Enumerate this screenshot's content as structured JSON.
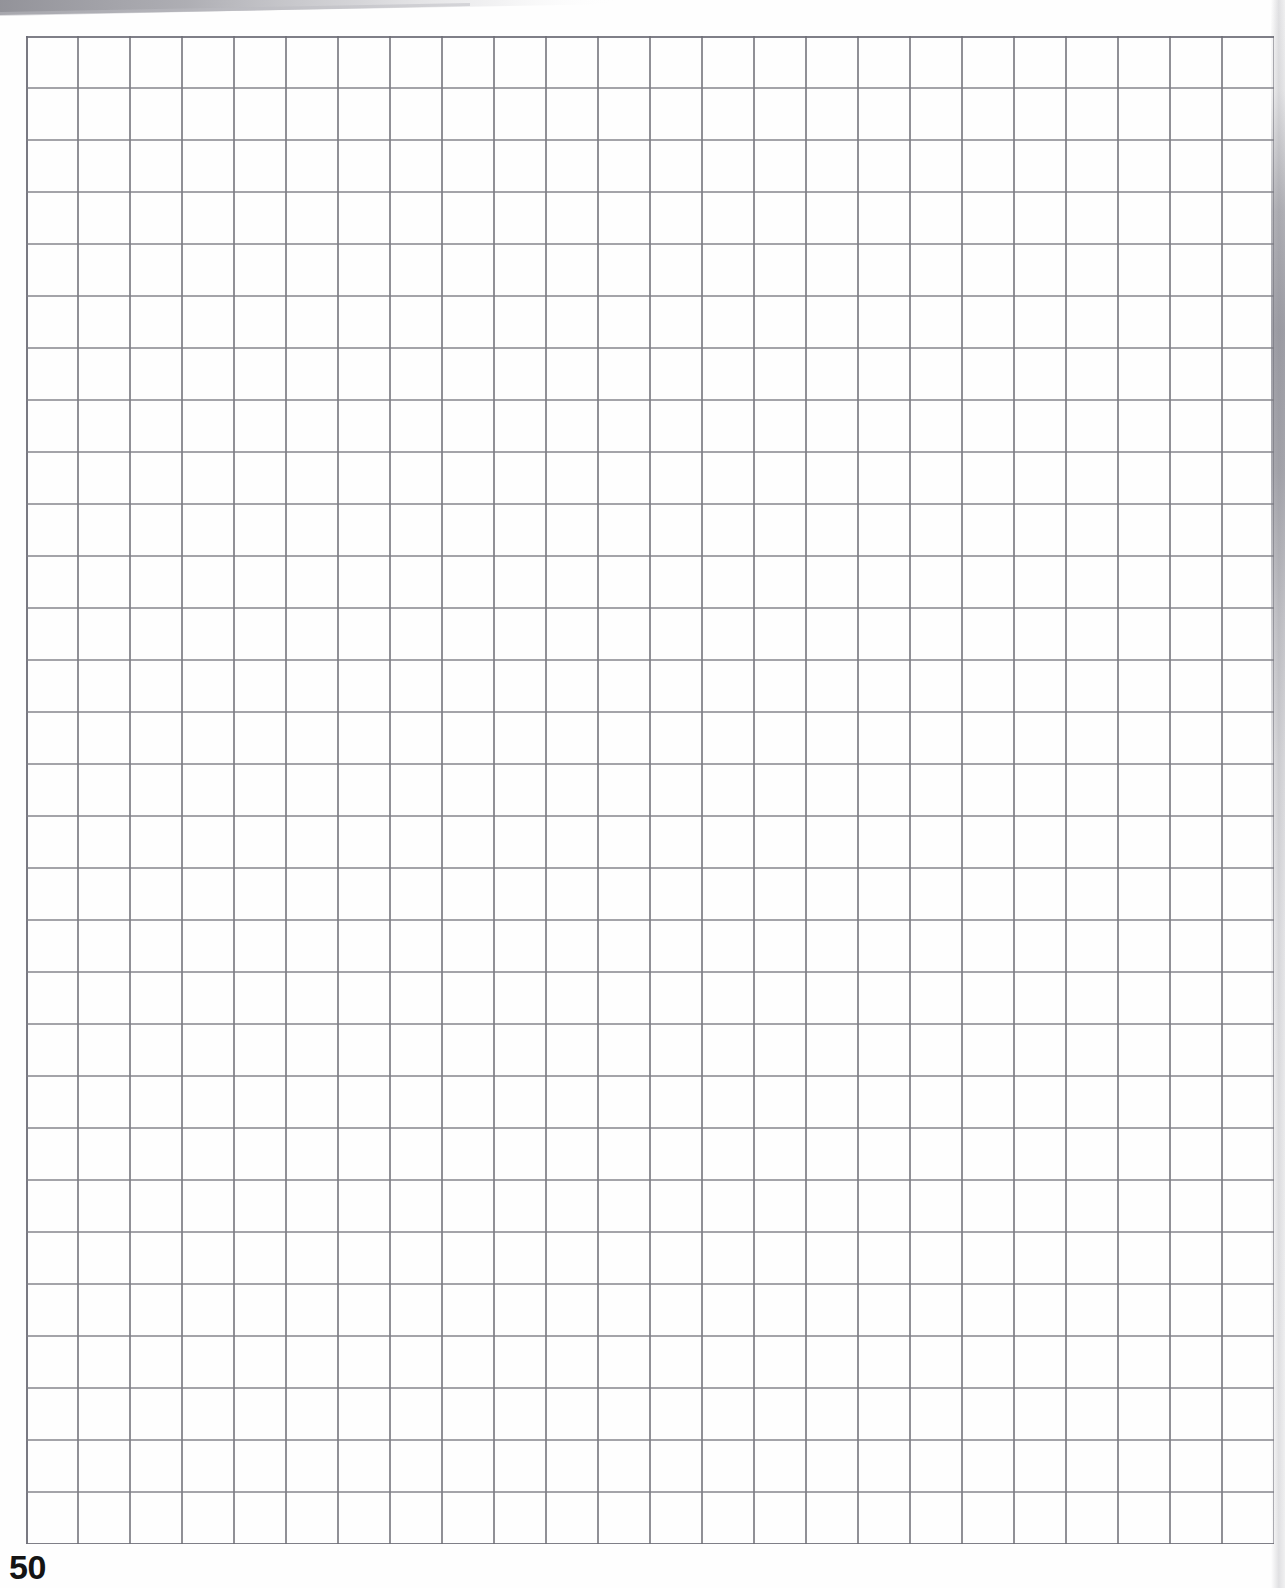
{
  "document": {
    "type": "graph-paper-page",
    "page_number": "50",
    "paper_color": "#fefefe"
  },
  "grid": {
    "columns": 24,
    "rows": 29,
    "cell_width_px": 52,
    "cell_height_px": 52,
    "origin_x_px": 26,
    "origin_y_px": 36,
    "line_color": "#7e7e86",
    "line_width_px": 2,
    "border_color": "#6e6e78",
    "border_width_px": 2
  },
  "artifacts": {
    "top_wedge_shadow": {
      "name": "top-left-diagonal-scan-shadow",
      "color": "#9a9aa0"
    },
    "right_edge_shadow": {
      "name": "right-edge-page-curl-shadow",
      "color": "#82828c"
    }
  },
  "footer": {
    "page_label": "50"
  }
}
